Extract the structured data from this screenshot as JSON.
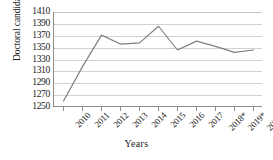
{
  "chart_data": {
    "type": "line",
    "title": "",
    "xlabel": "Years",
    "ylabel": "Doctoral candidates",
    "categories": [
      "2010",
      "2011",
      "2012",
      "2013",
      "2014",
      "2015",
      "2016",
      "2017",
      "2018*",
      "2019*",
      "2020*"
    ],
    "values": [
      1260,
      1318,
      1371,
      1356,
      1358,
      1386,
      1346,
      1361,
      1352,
      1342,
      1346
    ],
    "series": [
      {
        "name": "Doctoral candidates",
        "values": [
          1260,
          1318,
          1371,
          1356,
          1358,
          1386,
          1346,
          1361,
          1352,
          1342,
          1346
        ]
      }
    ],
    "ylim": [
      1250,
      1410
    ],
    "ytick_step": 20,
    "yticks": [
      1410,
      1390,
      1370,
      1350,
      1330,
      1310,
      1290,
      1270,
      1250
    ],
    "grid": true,
    "legend": "none",
    "line_color": "#7f7f7f",
    "grid_color": "#d2d2d2",
    "axis_color": "#8f8f8f"
  }
}
